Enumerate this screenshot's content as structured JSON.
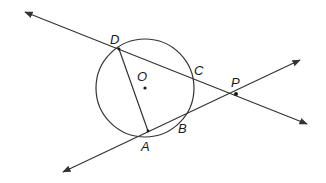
{
  "diagram": {
    "type": "geometry",
    "colors": {
      "stroke": "#333333",
      "background": "#ffffff",
      "text": "#1a1a1a"
    },
    "circle": {
      "center_label": "O",
      "cx": 145,
      "cy": 88,
      "r": 49
    },
    "points": [
      {
        "label": "D",
        "x": 119,
        "y": 49
      },
      {
        "label": "C",
        "x": 191,
        "y": 79
      },
      {
        "label": "P",
        "x": 236,
        "y": 94
      },
      {
        "label": "B",
        "x": 181,
        "y": 119
      },
      {
        "label": "A",
        "x": 148,
        "y": 131
      },
      {
        "label": "O",
        "x": 145,
        "y": 88
      }
    ],
    "lines": [
      {
        "name": "line-DP",
        "from": [
          25,
          12
        ],
        "to": [
          307,
          124
        ],
        "arrows": "both",
        "passes_through": [
          "D",
          "C",
          "P"
        ]
      },
      {
        "name": "line-AP",
        "from": [
          63,
          172
        ],
        "to": [
          300,
          60
        ],
        "arrows": "both",
        "passes_through": [
          "A",
          "B",
          "P"
        ]
      }
    ],
    "segments": [
      {
        "name": "chord-DA",
        "from": "D",
        "to": "A"
      }
    ]
  }
}
